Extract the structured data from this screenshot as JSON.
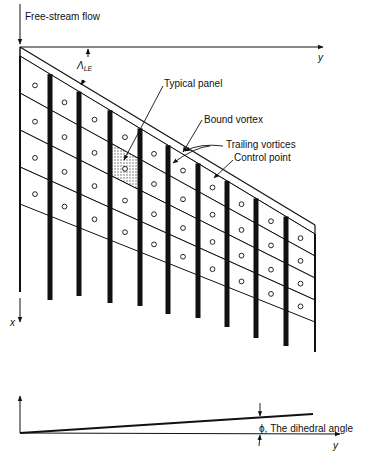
{
  "labels": {
    "free_stream": "Free-stream flow",
    "y_axis_top": "y",
    "sweep_symbol": "Λ",
    "sweep_subscript": "LE",
    "typical_panel": "Typical panel",
    "bound_vortex": "Bound vortex",
    "trailing_vortices": "Trailing vortices",
    "control_point": "Control point",
    "x_axis": "x",
    "dihedral": "ϕ, The dihedral angle",
    "y_axis_bottom": "y"
  },
  "geometry": {
    "le_root": [
      20,
      47
    ],
    "le_tip": [
      315,
      225
    ],
    "le_offset": 9,
    "column_edges_x": [
      20,
      50,
      79,
      110,
      140,
      168,
      198,
      227,
      256,
      286,
      315
    ],
    "rows_per_column": 4,
    "root_chord_row": 37,
    "tip_chord_row": 22,
    "trailing_end_y": [
      292,
      300,
      296,
      303,
      306,
      314,
      318,
      327,
      338,
      346,
      352
    ],
    "typical_panel": {
      "column": 3,
      "row": 1
    },
    "dihedral": {
      "origin": [
        20,
        433
      ],
      "tip": [
        313,
        414
      ],
      "axis_end": [
        340,
        434
      ],
      "vert_top": 396
    }
  },
  "colors": {
    "ink": "#111111",
    "background": "#ffffff",
    "panel_hatch": "#9a9a9a"
  }
}
